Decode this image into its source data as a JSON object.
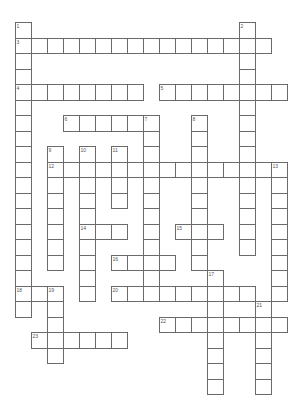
{
  "puzzle": {
    "layout": {
      "origin_x": 14.5,
      "origin_y": 22,
      "col_pitch": 16,
      "row_pitch": 15.5
    },
    "colors": {
      "border": "#6a6a6a",
      "cell_fill": "#ffffff",
      "number": "#555555",
      "background": "#ffffff"
    },
    "words": [
      {
        "number": "1",
        "direction": "down",
        "col": 0,
        "row": 0,
        "length": 17
      },
      {
        "number": "2",
        "direction": "down",
        "col": 14,
        "row": 0,
        "length": 15
      },
      {
        "number": "3",
        "direction": "across",
        "col": 0,
        "row": 1,
        "length": 16
      },
      {
        "number": "4",
        "direction": "across",
        "col": 0,
        "row": 4,
        "length": 8
      },
      {
        "number": "5",
        "direction": "across",
        "col": 9,
        "row": 4,
        "length": 8
      },
      {
        "number": "6",
        "direction": "across",
        "col": 3,
        "row": 6,
        "length": 6
      },
      {
        "number": "7",
        "direction": "down",
        "col": 8,
        "row": 6,
        "length": 12
      },
      {
        "number": "8",
        "direction": "down",
        "col": 11,
        "row": 6,
        "length": 10
      },
      {
        "number": "9",
        "direction": "down",
        "col": 2,
        "row": 8,
        "length": 8
      },
      {
        "number": "10",
        "direction": "down",
        "col": 4,
        "row": 8,
        "length": 10
      },
      {
        "number": "11",
        "direction": "down",
        "col": 6,
        "row": 8,
        "length": 4
      },
      {
        "number": "12",
        "direction": "across",
        "col": 2,
        "row": 9,
        "length": 15
      },
      {
        "number": "13",
        "direction": "down",
        "col": 16,
        "row": 9,
        "length": 9
      },
      {
        "number": "14",
        "direction": "across",
        "col": 4,
        "row": 13,
        "length": 3
      },
      {
        "number": "15",
        "direction": "across",
        "col": 10,
        "row": 13,
        "length": 3
      },
      {
        "number": "16",
        "direction": "across",
        "col": 6,
        "row": 15,
        "length": 4
      },
      {
        "number": "17",
        "direction": "down",
        "col": 12,
        "row": 16,
        "length": 8
      },
      {
        "number": "18",
        "direction": "across",
        "col": 0,
        "row": 17,
        "length": 3
      },
      {
        "number": "18",
        "direction": "down",
        "col": 0,
        "row": 17,
        "length": 2
      },
      {
        "number": "19",
        "direction": "down",
        "col": 2,
        "row": 17,
        "length": 5
      },
      {
        "number": "20",
        "direction": "across",
        "col": 6,
        "row": 17,
        "length": 9
      },
      {
        "number": "21",
        "direction": "down",
        "col": 15,
        "row": 18,
        "length": 6
      },
      {
        "number": "22",
        "direction": "across",
        "col": 9,
        "row": 19,
        "length": 8
      },
      {
        "number": "23",
        "direction": "across",
        "col": 1,
        "row": 20,
        "length": 6
      }
    ]
  }
}
